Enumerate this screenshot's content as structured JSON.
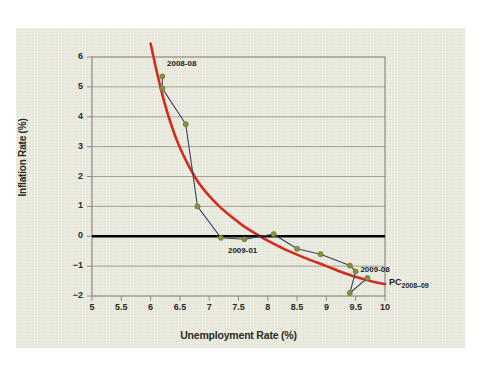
{
  "figure": {
    "background": "#ffffff",
    "panel_color": "#e9eadd"
  },
  "chart_data": {
    "type": "scatter",
    "title": "",
    "xlabel": "Unemployment Rate (%)",
    "ylabel": "Inflation Rate (%)",
    "xlim": [
      5,
      10
    ],
    "ylim": [
      -2,
      6
    ],
    "grid": true,
    "legend_position": "inline-right",
    "xticks": [
      "5",
      "5.5",
      "6",
      "6.5",
      "7",
      "7.5",
      "8",
      "8.5",
      "9",
      "9.5",
      "10"
    ],
    "xtick_values": [
      5,
      5.5,
      6,
      6.5,
      7,
      7.5,
      8,
      8.5,
      9,
      9.5,
      10
    ],
    "yticks": [
      "6",
      "5",
      "4",
      "3",
      "2",
      "1",
      "0",
      "-1",
      "-2"
    ],
    "ytick_values": [
      6,
      5,
      4,
      3,
      2,
      1,
      0,
      -1,
      -2
    ],
    "zero_line": 0,
    "series": [
      {
        "name": "Observed monthly data 2008-08 to 2009-08",
        "type": "line-marker",
        "line_color": "#3a4060",
        "marker_color": "#8a8f3a",
        "marker_edge": "#6f7430",
        "x": [
          6.2,
          6.2,
          6.6,
          6.8,
          7.2,
          7.6,
          8.1,
          8.5,
          8.9,
          9.4,
          9.5,
          9.4,
          9.7
        ],
        "y": [
          5.35,
          4.95,
          3.75,
          1.0,
          -0.05,
          -0.1,
          0.07,
          -0.42,
          -0.6,
          -0.98,
          -1.18,
          -1.9,
          -1.4
        ]
      },
      {
        "name": "PC 2008-09",
        "type": "curve",
        "line_color": "#d52b1e",
        "x": [
          6.0,
          6.05,
          6.1,
          6.2,
          6.3,
          6.45,
          6.6,
          6.8,
          7.0,
          7.2,
          7.4,
          7.6,
          7.8,
          8.0,
          8.3,
          8.6,
          9.0,
          9.4,
          9.8,
          10.0
        ],
        "y": [
          6.45,
          6.0,
          5.55,
          4.75,
          4.05,
          3.2,
          2.55,
          1.85,
          1.35,
          0.95,
          0.62,
          0.32,
          0.08,
          -0.15,
          -0.45,
          -0.7,
          -1.0,
          -1.3,
          -1.52,
          -1.6
        ]
      }
    ],
    "annotations": [
      {
        "text": "2008-08",
        "x": 6.28,
        "y": 5.75,
        "anchor": "left"
      },
      {
        "text": "2009-01",
        "x": 7.32,
        "y": -0.48,
        "anchor": "left"
      },
      {
        "text": "2009-08",
        "x": 9.58,
        "y": -1.12,
        "anchor": "left"
      }
    ],
    "curve_label": {
      "base": "PC",
      "subscript": "2008–09"
    }
  }
}
